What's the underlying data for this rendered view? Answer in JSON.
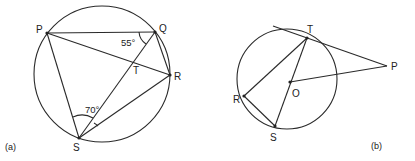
{
  "figures": [
    {
      "id": "a",
      "caption": "(a)",
      "circle": {
        "cx": 102,
        "cy": 74,
        "r": 68
      },
      "points": {
        "P": {
          "label": "P",
          "x": 47,
          "y": 33
        },
        "Q": {
          "label": "Q",
          "x": 155,
          "y": 32
        },
        "R": {
          "label": "R",
          "x": 170,
          "y": 75
        },
        "S": {
          "label": "S",
          "x": 79,
          "y": 138
        },
        "T": {
          "label": "T",
          "x": 134,
          "y": 64
        }
      },
      "segments": [
        "PQ",
        "PR",
        "PS",
        "QR",
        "QS",
        "SR"
      ],
      "angles": [
        {
          "at": "Q",
          "between": "PQ,QS",
          "value": "55°"
        },
        {
          "at": "S",
          "between": "PS,SQ",
          "value": "70°"
        }
      ]
    },
    {
      "id": "b",
      "caption": "(b)",
      "circle": {
        "cx": 287,
        "cy": 79,
        "r": 50
      },
      "points": {
        "T": {
          "label": "T",
          "x": 307,
          "y": 38
        },
        "O": {
          "label": "O",
          "x": 290,
          "y": 82
        },
        "P": {
          "label": "P",
          "x": 387,
          "y": 66
        },
        "R": {
          "label": "R",
          "x": 244,
          "y": 96
        },
        "S": {
          "label": "S",
          "x": 275,
          "y": 126
        }
      },
      "segments": [
        "TP (tangent)",
        "OP",
        "TS (diameter)",
        "TR",
        "RS"
      ]
    }
  ]
}
